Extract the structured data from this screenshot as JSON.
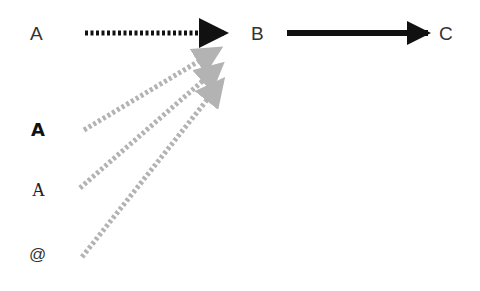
{
  "nodes": {
    "a_top": {
      "text": "A",
      "style": "sans-regular"
    },
    "b": {
      "text": "B",
      "style": "sans-regular"
    },
    "c": {
      "text": "C",
      "style": "sans-regular"
    },
    "a_bold": {
      "text": "A",
      "style": "sans-bold"
    },
    "a_serif": {
      "text": "A",
      "style": "serif"
    },
    "at": {
      "text": "@",
      "style": "sans-regular"
    }
  },
  "edges": [
    {
      "from": "A",
      "to": "B",
      "style": "dotted",
      "color": "#111111"
    },
    {
      "from": "B",
      "to": "C",
      "style": "solid",
      "color": "#111111"
    },
    {
      "from": "A (bold)",
      "to": "B",
      "style": "dotted",
      "color": "#b3b3b3"
    },
    {
      "from": "A (serif)",
      "to": "B",
      "style": "dotted",
      "color": "#b3b3b3"
    },
    {
      "from": "@",
      "to": "B",
      "style": "dotted",
      "color": "#b3b3b3"
    }
  ],
  "colors": {
    "primary": "#111111",
    "muted": "#b3b3b3",
    "text": "#333333",
    "background": "#ffffff"
  }
}
